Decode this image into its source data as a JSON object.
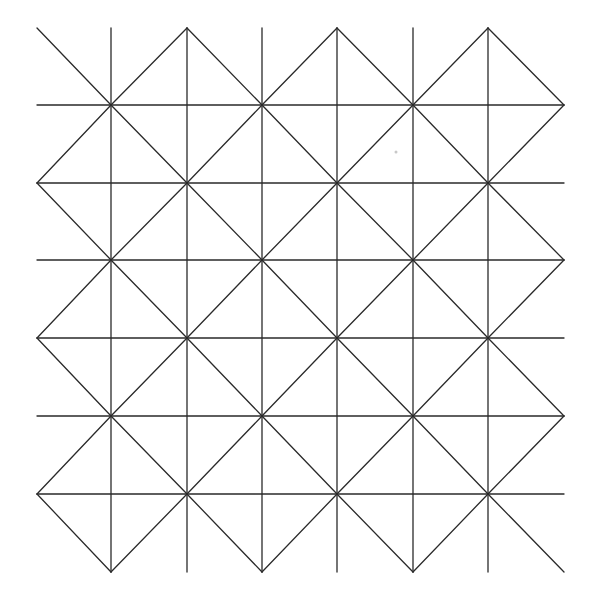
{
  "diagram": {
    "type": "diamond-lattice-grid",
    "background": "#ffffff",
    "stroke_color": "#2a2a2a",
    "columns_x": [
      37,
      111,
      187,
      262,
      337,
      413,
      488,
      564
    ],
    "rows_y": [
      28,
      105,
      183,
      260,
      338,
      416,
      494,
      572
    ],
    "vertical_lines": {
      "x": [
        111,
        187,
        262,
        337,
        413,
        488
      ],
      "y_start": 28,
      "y_end": 572
    },
    "horizontal_lines": {
      "y": [
        105,
        183,
        260,
        338,
        416,
        494
      ],
      "x_start": 37,
      "x_end": 564
    },
    "vertex_rule": "diamond vertices at grid nodes where column index + row index is even",
    "stray_dot": {
      "x": 396,
      "y": 152,
      "color": "#c8c8c8"
    }
  }
}
